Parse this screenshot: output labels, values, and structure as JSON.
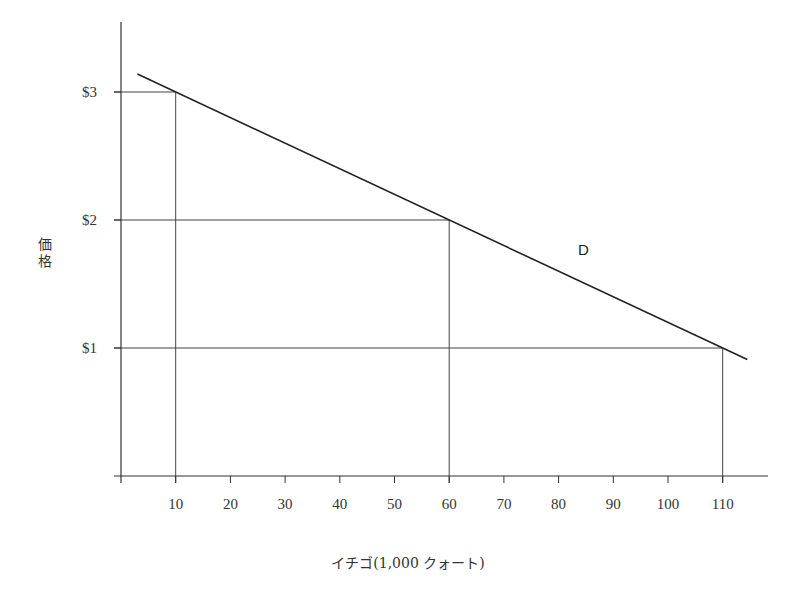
{
  "chart_data": {
    "type": "line",
    "title": "",
    "xlabel": "イチゴ(1,000 クォート)",
    "ylabel": "価格",
    "x_ticks": [
      10,
      20,
      30,
      40,
      50,
      60,
      70,
      80,
      90,
      100,
      110
    ],
    "y_ticks": [
      "$1",
      "$2",
      "$3"
    ],
    "y_tick_values": [
      1,
      2,
      3
    ],
    "xlim": [
      0,
      115
    ],
    "ylim": [
      0,
      3.5
    ],
    "grid": false,
    "series": [
      {
        "name": "D",
        "label": "D",
        "x": [
          10,
          60,
          110
        ],
        "y": [
          3,
          2,
          1
        ]
      }
    ],
    "guide_points": [
      {
        "x": 10,
        "y": 3
      },
      {
        "x": 60,
        "y": 2
      },
      {
        "x": 110,
        "y": 1
      }
    ]
  },
  "labels": {
    "curve": "D",
    "x_axis_title": "イチゴ(1,000 クォート)",
    "y_axis_title_line1": "価",
    "y_axis_title_line2": "格"
  },
  "colors": {
    "axis": "#333333",
    "curve": "#222222",
    "guide": "#444444"
  }
}
